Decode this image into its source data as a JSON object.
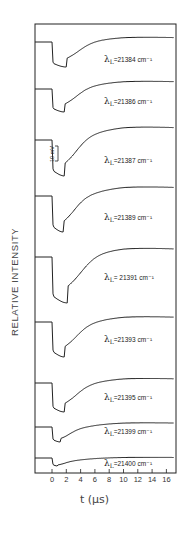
{
  "chart_data": {
    "type": "line",
    "title": "",
    "xlabel": "t (μs)",
    "ylabel": "RELATIVE INTENSITY",
    "x_ticks": [
      0,
      2,
      4,
      6,
      8,
      10,
      12,
      14,
      16
    ],
    "xlim": [
      -2.5,
      17
    ],
    "scale_bar": "10 mV",
    "layout": "stacked panels, one transient trace per laser wavelength",
    "series": [
      {
        "name": "λL = 21384 cm⁻¹",
        "label_main": "λ",
        "label_sub": "L",
        "label_value": "=21384 cm⁻¹",
        "depth": 1.0,
        "min_t": 2.0,
        "recover": 0.95
      },
      {
        "name": "λL = 21386 cm⁻¹",
        "label_main": "λ",
        "label_sub": "L",
        "label_value": "=21386 cm⁻¹",
        "depth": 1.0,
        "min_t": 1.8,
        "recover": 0.93
      },
      {
        "name": "λL = 21387 cm⁻¹",
        "label_main": "λ",
        "label_sub": "L",
        "label_value": "=21387 cm⁻¹",
        "depth": 1.0,
        "min_t": 1.8,
        "recover": 0.92
      },
      {
        "name": "λL = 21389 cm⁻¹",
        "label_main": "λ",
        "label_sub": "L",
        "label_value": "=21389 cm⁻¹",
        "depth": 1.0,
        "min_t": 1.6,
        "recover": 0.93
      },
      {
        "name": "λL = 21391 cm⁻¹",
        "label_main": "λ",
        "label_sub": "L",
        "label_value": "= 21391 cm⁻¹",
        "depth": 1.0,
        "min_t": 2.2,
        "recover": 0.92
      },
      {
        "name": "λL = 21393 cm⁻¹",
        "label_main": "λ",
        "label_sub": "L",
        "label_value": "=21393 cm⁻¹",
        "depth": 1.0,
        "min_t": 1.8,
        "recover": 0.92
      },
      {
        "name": "λL = 21395 cm⁻¹",
        "label_main": "λ",
        "label_sub": "L",
        "label_value": "=21395 cm⁻¹",
        "depth": 1.0,
        "min_t": 1.8,
        "recover": 0.9
      },
      {
        "name": "λL = 21399 cm⁻¹",
        "label_main": "λ",
        "label_sub": "L",
        "label_value": "=21399 cm⁻¹",
        "depth": 1.0,
        "min_t": 1.2,
        "recover": 0.9
      },
      {
        "name": "λL = 21400 cm⁻¹",
        "label_main": "λ",
        "label_sub": "L",
        "label_value": "=21400 cm⁻¹",
        "depth": 1.0,
        "min_t": 0.8,
        "recover": 0.85
      }
    ]
  },
  "panels": [
    {
      "top": 24,
      "bottom": 69,
      "base": 42,
      "min": 67,
      "top_rec": 36,
      "label_y": 62
    },
    {
      "top": 69,
      "bottom": 113,
      "base": 89,
      "min": 112,
      "top_rec": 80,
      "label_y": 104
    },
    {
      "top": 113,
      "bottom": 161,
      "base": 140,
      "min": 176,
      "top_rec": 125,
      "label_y": 163
    },
    {
      "top": 161,
      "bottom": 208,
      "base": 196,
      "min": 232,
      "top_rec": 185,
      "label_y": 220
    },
    {
      "top": 208,
      "bottom": 263,
      "base": 257,
      "min": 303,
      "top_rec": 246,
      "label_y": 280
    },
    {
      "top": 263,
      "bottom": 325,
      "base": 322,
      "min": 357,
      "top_rec": 315,
      "label_y": 342
    },
    {
      "top": 325,
      "bottom": 378,
      "base": 383,
      "min": 412,
      "top_rec": 377,
      "label_y": 400
    },
    {
      "top": 378,
      "bottom": 419,
      "base": 427,
      "min": 442,
      "top_rec": 422,
      "label_y": 434
    },
    {
      "top": 419,
      "bottom": 455,
      "base": 458,
      "min": 466,
      "top_rec": 457,
      "label_y": 466
    }
  ],
  "axes": {
    "x0_px": 52,
    "px_per_us": 7.15,
    "frame_left": 35,
    "frame_right": 176,
    "frame_top": 24,
    "frame_bottom": 473,
    "tick_labels": [
      "0",
      "2",
      "4",
      "6",
      "8",
      "10",
      "12",
      "14",
      "16"
    ]
  }
}
